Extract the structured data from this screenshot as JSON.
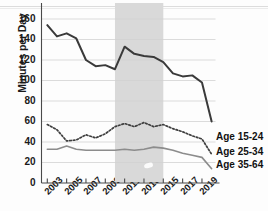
{
  "chart_data": {
    "type": "line",
    "title": "",
    "xlabel": "",
    "ylabel": "Minutes per Day",
    "x": [
      2003,
      2004,
      2005,
      2006,
      2007,
      2008,
      2009,
      2010,
      2011,
      2012,
      2013,
      2014,
      2015,
      2016,
      2017,
      2018,
      2019,
      2020
    ],
    "xticklabels": [
      "2003",
      "2005",
      "2007",
      "2009",
      "2011",
      "2013",
      "2015",
      "2017",
      "2019"
    ],
    "xtickvalues": [
      2003,
      2005,
      2007,
      2009,
      2011,
      2013,
      2015,
      2017,
      2019
    ],
    "yticklabels": [
      "0",
      "20",
      "40",
      "60",
      "80",
      "100",
      "120",
      "140",
      "160"
    ],
    "ytickvalues": [
      0,
      20,
      40,
      60,
      80,
      100,
      120,
      140,
      160
    ],
    "ylim": [
      0,
      160
    ],
    "xlim": [
      2002.4,
      2020.4
    ],
    "grid": true,
    "grid_axis": "y",
    "legend_position": "right-inline",
    "shaded_band": {
      "x_start": 2010,
      "x_end": 2015,
      "color": "#d9d9d9"
    },
    "series": [
      {
        "name": "Age 15-24",
        "style": "solid",
        "color": "#3a3a3a",
        "width": 2.0,
        "values": [
          154,
          143,
          146,
          141,
          120,
          114,
          115,
          111,
          133,
          126,
          124,
          123,
          118,
          107,
          104,
          105,
          98,
          60
        ]
      },
      {
        "name": "Age 25-34",
        "style": "dotted",
        "color": "#3f3f3f",
        "width": 1.7,
        "values": [
          57,
          52,
          41,
          42,
          47,
          44,
          48,
          55,
          58,
          55,
          59,
          55,
          57,
          53,
          50,
          46,
          43,
          28
        ]
      },
      {
        "name": "Age 35-64",
        "style": "solid",
        "color": "#8c8c8c",
        "width": 1.6,
        "values": [
          33,
          33,
          36,
          33,
          32,
          32,
          32,
          32,
          33,
          32,
          33,
          35,
          34,
          32,
          29,
          27,
          25,
          14
        ]
      }
    ]
  },
  "axis": {
    "ylabel": "Minutes per Day"
  },
  "legend": {
    "items": [
      {
        "label": "Age 15-24"
      },
      {
        "label": "Age 25-34"
      },
      {
        "label": "Age 35-64"
      }
    ]
  }
}
